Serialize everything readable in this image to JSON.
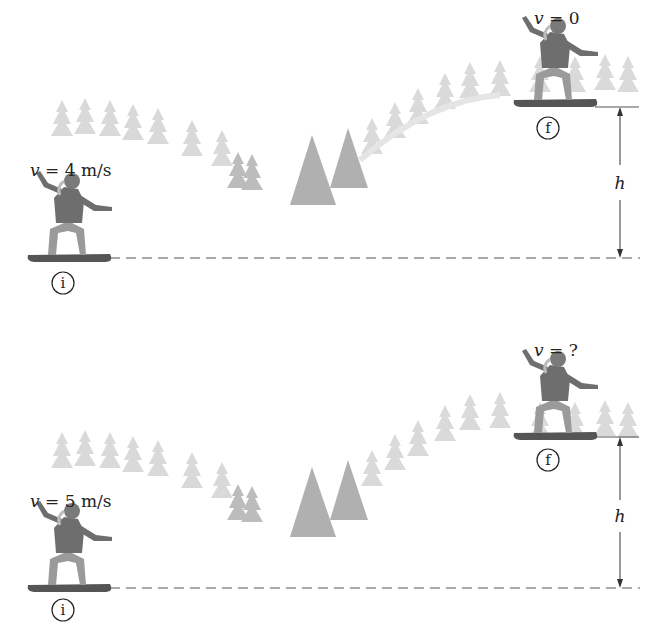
{
  "figure": {
    "type": "energy-conservation diagram",
    "panels": [
      {
        "id": "top",
        "initial": {
          "marker": "i",
          "velocity_label": "v = 4 m/s",
          "v_symbol": "v",
          "v_value": "= 4 m/s"
        },
        "final": {
          "marker": "f",
          "velocity_label": "v = 0",
          "v_symbol": "v",
          "v_value": "= 0"
        },
        "height_label": "h"
      },
      {
        "id": "bottom",
        "initial": {
          "marker": "i",
          "velocity_label": "v = 5 m/s",
          "v_symbol": "v",
          "v_value": "= 5 m/s"
        },
        "final": {
          "marker": "f",
          "velocity_label": "v = ?",
          "v_symbol": "v",
          "v_value": "= ?"
        },
        "height_label": "h"
      }
    ],
    "colors": {
      "ink": "#222222",
      "snowboarder": "#6b6b6b",
      "trees_dark": "#a8a8a8",
      "trees_light": "#d4d4d4",
      "dash": "#555555"
    }
  }
}
